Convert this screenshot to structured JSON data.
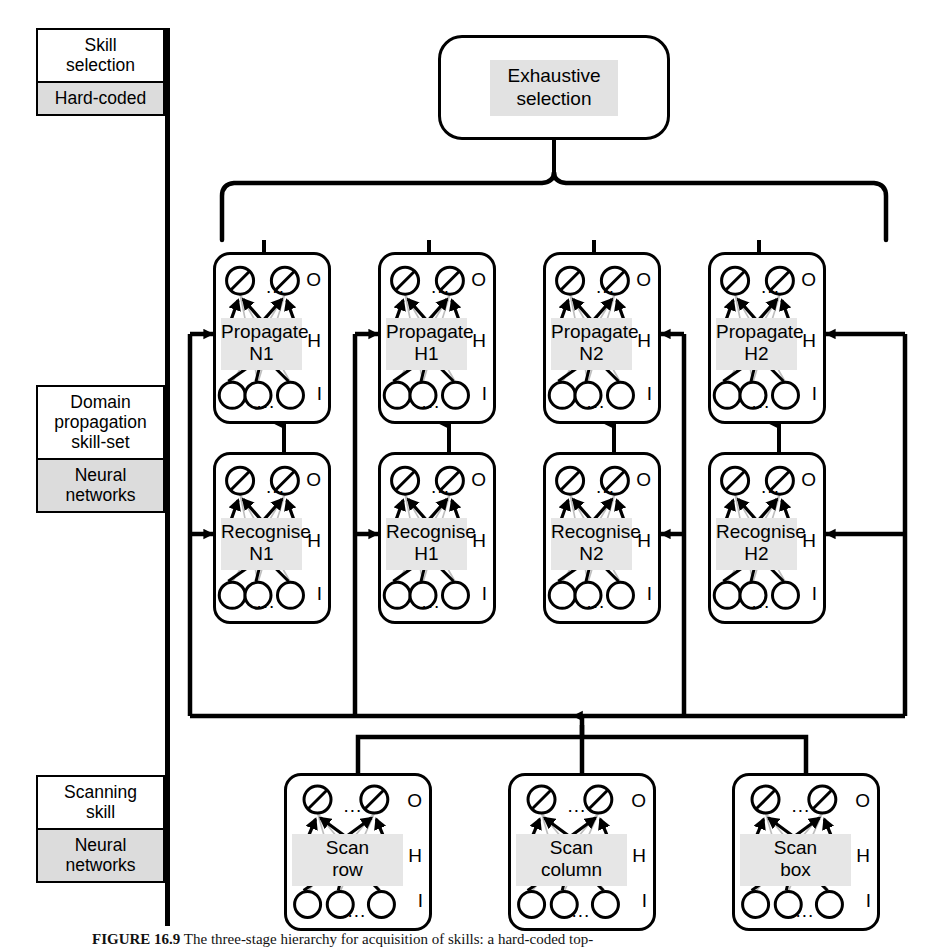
{
  "figure": {
    "caption_label": "FIGURE 16.9",
    "caption_text": "The three-stage hierarchy for acquisition of skills: a hard-coded top-"
  },
  "legend": {
    "groups": [
      {
        "title": "Skill\nselection",
        "implementation": "Hard-coded"
      },
      {
        "title": "Domain\npropagation\nskill-set",
        "implementation": "Neural\nnetworks"
      },
      {
        "title": "Scanning\nskill",
        "implementation": "Neural\nnetworks"
      }
    ]
  },
  "top": {
    "label": "Exhaustive\nselection"
  },
  "layers": {
    "letters": {
      "output": "O",
      "hidden": "H",
      "input": "I"
    },
    "ellipsis": "..."
  },
  "propagate_row": [
    {
      "line1": "Propagate",
      "line2": "N1"
    },
    {
      "line1": "Propagate",
      "line2": "H1"
    },
    {
      "line1": "Propagate",
      "line2": "N2"
    },
    {
      "line1": "Propagate",
      "line2": "H2"
    }
  ],
  "recognise_row": [
    {
      "line1": "Recognise",
      "line2": "N1"
    },
    {
      "line1": "Recognise",
      "line2": "H1"
    },
    {
      "line1": "Recognise",
      "line2": "N2"
    },
    {
      "line1": "Recognise",
      "line2": "H2"
    }
  ],
  "scan_row": [
    {
      "line1": "Scan",
      "line2": "row"
    },
    {
      "line1": "Scan",
      "line2": "column"
    },
    {
      "line1": "Scan",
      "line2": "box"
    }
  ],
  "colors": {
    "ink": "#000000",
    "paper": "#ffffff",
    "label_highlight": "#e6e6e6",
    "legend_highlight": "#dcdcdc"
  }
}
